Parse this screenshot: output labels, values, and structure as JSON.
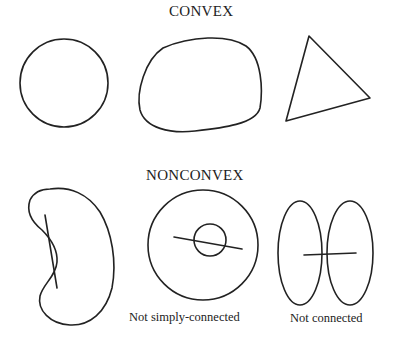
{
  "diagram": {
    "sections": [
      {
        "heading": "CONVEX",
        "shapes": [
          {
            "name": "circle",
            "caption": ""
          },
          {
            "name": "rounded-blob",
            "caption": ""
          },
          {
            "name": "triangle",
            "caption": ""
          }
        ]
      },
      {
        "heading": "NONCONVEX",
        "shapes": [
          {
            "name": "kidney-shape-with-chord",
            "caption": ""
          },
          {
            "name": "annulus-with-chord",
            "caption": "Not simply-connected"
          },
          {
            "name": "two-ellipses-with-chord",
            "caption": "Not connected"
          }
        ]
      }
    ],
    "colors": {
      "stroke": "#222222",
      "background": "#ffffff",
      "text": "#222222"
    }
  }
}
